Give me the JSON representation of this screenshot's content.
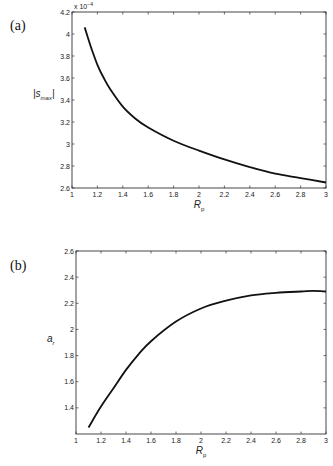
{
  "panels": {
    "a": {
      "label": "(a)"
    },
    "b": {
      "label": "(b)"
    }
  },
  "chart_data": [
    {
      "type": "line",
      "panel": "(a)",
      "title": "",
      "xlabel": "R_p",
      "ylabel": "|s_max|",
      "y_multiplier": "x 10^-4",
      "xlim": [
        1,
        3
      ],
      "ylim": [
        2.6,
        4.2
      ],
      "xticks": [
        "1",
        "1.2",
        "1.4",
        "1.6",
        "1.8",
        "2",
        "2.2",
        "2.4",
        "2.6",
        "2.8",
        "3"
      ],
      "yticks": [
        "2.6",
        "2.8",
        "3",
        "3.2",
        "3.4",
        "3.6",
        "3.8",
        "4",
        "4.2"
      ],
      "grid": false,
      "series": [
        {
          "name": "|s_max|",
          "x": [
            1.1,
            1.15,
            1.2,
            1.25,
            1.3,
            1.4,
            1.5,
            1.6,
            1.8,
            2.0,
            2.2,
            2.4,
            2.6,
            2.8,
            3.0
          ],
          "values": [
            4.06,
            3.88,
            3.72,
            3.6,
            3.5,
            3.34,
            3.23,
            3.15,
            3.03,
            2.94,
            2.86,
            2.79,
            2.73,
            2.69,
            2.65
          ]
        }
      ]
    },
    {
      "type": "line",
      "panel": "(b)",
      "title": "",
      "xlabel": "R_p",
      "ylabel": "a_r",
      "xlim": [
        1,
        3
      ],
      "ylim": [
        1.2,
        2.6
      ],
      "xticks": [
        "1",
        "1.2",
        "1.4",
        "1.6",
        "1.8",
        "2",
        "2.2",
        "2.4",
        "2.6",
        "2.8",
        "3"
      ],
      "yticks": [
        "1.4",
        "1.6",
        "1.8",
        "2",
        "2.2",
        "2.4",
        "2.6"
      ],
      "grid": false,
      "series": [
        {
          "name": "a_r",
          "x": [
            1.1,
            1.2,
            1.3,
            1.4,
            1.5,
            1.6,
            1.8,
            2.0,
            2.2,
            2.4,
            2.6,
            2.8,
            2.9,
            3.0
          ],
          "values": [
            1.25,
            1.41,
            1.55,
            1.69,
            1.81,
            1.91,
            2.06,
            2.16,
            2.22,
            2.26,
            2.28,
            2.29,
            2.295,
            2.29
          ]
        }
      ]
    }
  ]
}
